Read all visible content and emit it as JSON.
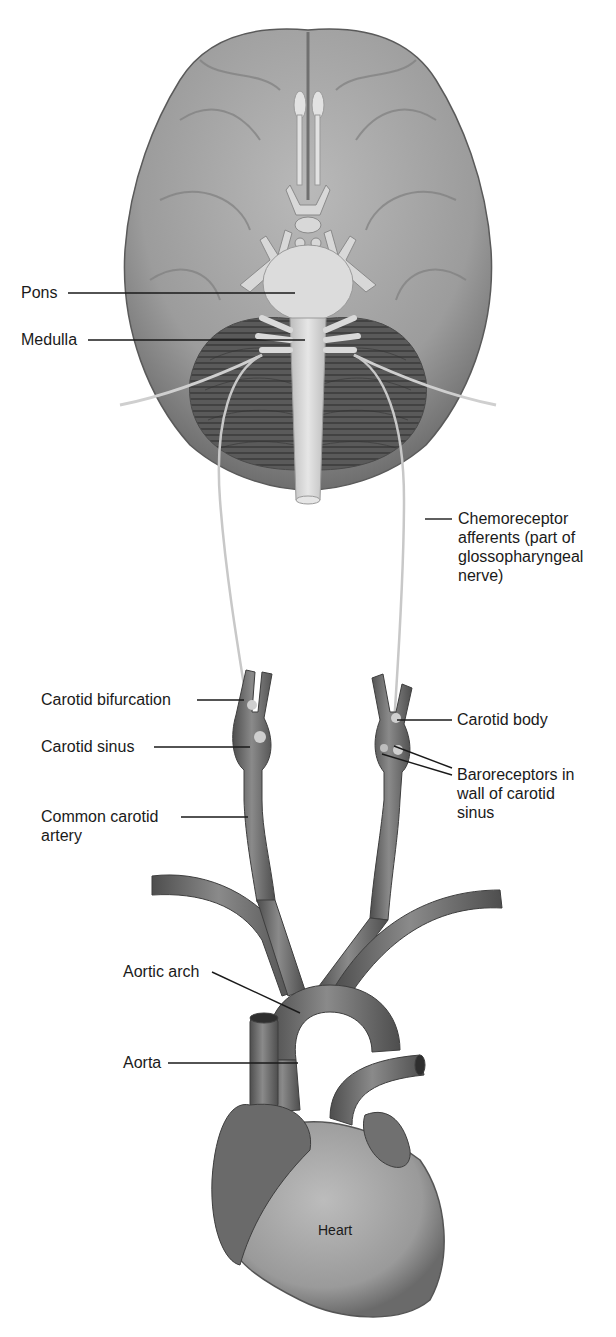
{
  "figure": {
    "colors": {
      "background": "#ffffff",
      "tissue_light": "#d6d6d6",
      "tissue_mid": "#9a9a9a",
      "tissue_dark": "#555555",
      "nerve": "#c8c8c8",
      "leader_line": "#1a1a1a",
      "text": "#1a1a1a"
    }
  },
  "labels": {
    "pons": "Pons",
    "medulla": "Medulla",
    "chemoreceptor_afferents": "Chemoreceptor afferents (part of glossopharyngeal nerve)",
    "carotid_bifurcation": "Carotid bifurcation",
    "carotid_sinus": "Carotid sinus",
    "common_carotid_artery": "Common carotid artery",
    "carotid_body": "Carotid body",
    "baroreceptors": "Baroreceptors in wall of carotid sinus",
    "aortic_arch": "Aortic arch",
    "aorta": "Aorta",
    "heart": "Heart"
  }
}
